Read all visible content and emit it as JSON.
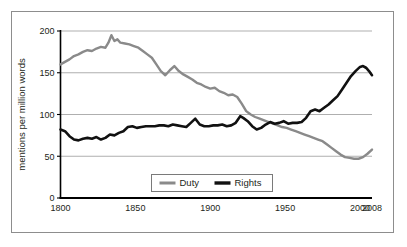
{
  "chart_data": {
    "type": "line",
    "title": "",
    "subtitle": "",
    "xlabel": "",
    "ylabel": "mentions per million words",
    "xlim": [
      1800,
      2008
    ],
    "ylim": [
      0,
      200
    ],
    "xticks": [
      1800,
      1850,
      1900,
      1950,
      2000,
      2008
    ],
    "xticklabels": [
      "1800",
      "1850",
      "1900",
      "1950",
      "2000",
      "2008"
    ],
    "yticks": [
      0,
      50,
      100,
      150,
      200
    ],
    "yticklabels": [
      "0",
      "50",
      "100",
      "150",
      "200"
    ],
    "grid": "horizontal",
    "legend_position": "bottom-center",
    "colors": {
      "duty": "#8a8a8a",
      "rights": "#111111",
      "gridline": "#a6a6a6",
      "axis": "#000000",
      "frame": "#8d8d8d",
      "text": "#231f20",
      "background": "#ffffff"
    },
    "series": [
      {
        "name": "Duty",
        "color": "#8a8a8a",
        "x": [
          1800,
          1803,
          1806,
          1809,
          1812,
          1815,
          1818,
          1821,
          1824,
          1827,
          1830,
          1832,
          1834,
          1836,
          1838,
          1840,
          1843,
          1846,
          1849,
          1852,
          1855,
          1858,
          1861,
          1864,
          1867,
          1870,
          1873,
          1876,
          1879,
          1882,
          1885,
          1888,
          1891,
          1894,
          1897,
          1900,
          1903,
          1906,
          1909,
          1912,
          1915,
          1918,
          1921,
          1924,
          1927,
          1930,
          1933,
          1936,
          1939,
          1942,
          1945,
          1948,
          1951,
          1954,
          1957,
          1960,
          1963,
          1966,
          1969,
          1972,
          1975,
          1978,
          1981,
          1984,
          1987,
          1990,
          1993,
          1996,
          1999,
          2002,
          2005,
          2008
        ],
        "y": [
          160,
          163,
          166,
          170,
          172,
          175,
          177,
          176,
          179,
          181,
          180,
          186,
          195,
          188,
          190,
          186,
          185,
          184,
          182,
          180,
          176,
          172,
          168,
          160,
          152,
          147,
          153,
          158,
          152,
          148,
          145,
          142,
          138,
          136,
          133,
          131,
          132,
          128,
          126,
          123,
          124,
          121,
          113,
          104,
          100,
          97,
          95,
          93,
          91,
          89,
          87,
          85,
          84,
          82,
          80,
          78,
          76,
          74,
          72,
          70,
          68,
          64,
          60,
          56,
          52,
          49,
          48,
          47,
          47,
          49,
          53,
          58
        ]
      },
      {
        "name": "Rights",
        "color": "#111111",
        "x": [
          1800,
          1803,
          1806,
          1809,
          1812,
          1815,
          1818,
          1821,
          1824,
          1827,
          1830,
          1833,
          1836,
          1839,
          1842,
          1845,
          1848,
          1851,
          1854,
          1857,
          1860,
          1863,
          1866,
          1869,
          1872,
          1875,
          1878,
          1881,
          1884,
          1887,
          1890,
          1893,
          1896,
          1899,
          1902,
          1905,
          1908,
          1911,
          1914,
          1917,
          1920,
          1922,
          1925,
          1928,
          1931,
          1934,
          1937,
          1940,
          1943,
          1946,
          1949,
          1952,
          1955,
          1958,
          1961,
          1964,
          1967,
          1970,
          1973,
          1976,
          1979,
          1982,
          1985,
          1988,
          1991,
          1994,
          1997,
          2000,
          2002,
          2004,
          2006,
          2008
        ],
        "y": [
          82,
          80,
          74,
          70,
          69,
          71,
          72,
          71,
          73,
          70,
          72,
          76,
          75,
          78,
          80,
          85,
          86,
          84,
          85,
          86,
          86,
          86,
          87,
          87,
          86,
          88,
          87,
          86,
          85,
          90,
          95,
          88,
          86,
          86,
          87,
          87,
          88,
          86,
          87,
          90,
          98,
          96,
          92,
          86,
          82,
          84,
          88,
          91,
          89,
          90,
          92,
          89,
          90,
          90,
          91,
          96,
          104,
          106,
          104,
          108,
          112,
          117,
          122,
          130,
          138,
          146,
          152,
          157,
          158,
          156,
          152,
          147
        ]
      }
    ]
  },
  "legend": {
    "items": [
      {
        "label": "Duty",
        "color": "#8a8a8a"
      },
      {
        "label": "Rights",
        "color": "#111111"
      }
    ]
  },
  "axes": {
    "y_title": "mentions per million words"
  }
}
